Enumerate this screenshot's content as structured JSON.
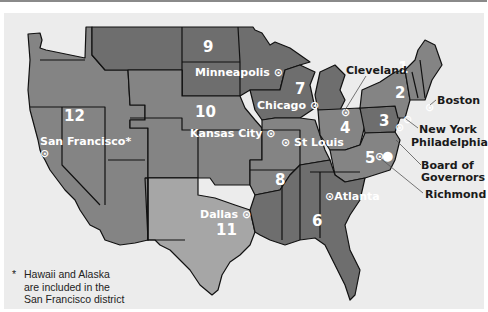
{
  "map": {
    "title": "Federal Reserve Districts",
    "colors": {
      "background": "#ececec",
      "district_dark": "#6e6e6e",
      "district_mid": "#848484",
      "district_light": "#a6a6a6",
      "border": "#111111",
      "label_light": "#ffffff",
      "label_dark": "#1a1a1a"
    },
    "districts": [
      {
        "number": "1",
        "city": "Boston"
      },
      {
        "number": "2",
        "city": "New York"
      },
      {
        "number": "3",
        "city": "Philadelphia"
      },
      {
        "number": "4",
        "city": "Cleveland"
      },
      {
        "number": "5",
        "city": "Richmond"
      },
      {
        "number": "6",
        "city": "Atlanta"
      },
      {
        "number": "7",
        "city": "Chicago"
      },
      {
        "number": "8",
        "city": "St Louis"
      },
      {
        "number": "9",
        "city": "Minneapolis"
      },
      {
        "number": "10",
        "city": "Kansas City"
      },
      {
        "number": "11",
        "city": "Dallas"
      },
      {
        "number": "12",
        "city": "San Francisco*"
      }
    ],
    "other_labels": {
      "board": "Board of Governors",
      "board_line1": "Board of",
      "board_line2": "Governors"
    },
    "footnote": {
      "star": "*",
      "line1": "Hawaii and Alaska",
      "line2": "are included in the",
      "line3": "San Francisco district"
    },
    "icons": {
      "reserve_bank": "circled-dot-icon",
      "board": "filled-circle-icon"
    }
  }
}
